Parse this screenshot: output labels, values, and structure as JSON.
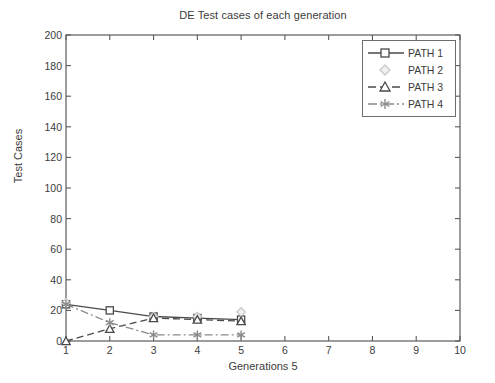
{
  "chart_data": {
    "type": "line",
    "title": "DE Test cases of each generation",
    "xlabel": "Generations 5",
    "ylabel": "Test Cases",
    "xlim": [
      1,
      10
    ],
    "ylim": [
      0,
      200
    ],
    "xticks": [
      "1",
      "2",
      "3",
      "4",
      "5",
      "6",
      "7",
      "8",
      "9",
      "10"
    ],
    "yticks": [
      "0",
      "20",
      "40",
      "60",
      "80",
      "100",
      "120",
      "140",
      "160",
      "180",
      "200"
    ],
    "grid": false,
    "legend_position": "top-right",
    "x": [
      1,
      2,
      3,
      4,
      5
    ],
    "series": [
      {
        "name": "PATH 1",
        "marker": "square",
        "linestyle": "solid",
        "color": "#4a4a4a",
        "values": [
          24,
          20,
          16,
          15,
          14
        ]
      },
      {
        "name": "PATH 2",
        "marker": "diamond",
        "linestyle": "none",
        "color": "#c9c9c9",
        "values": [
          25,
          null,
          16,
          16,
          19
        ]
      },
      {
        "name": "PATH 3",
        "marker": "triangle",
        "linestyle": "dashed",
        "color": "#4a4a4a",
        "values": [
          0,
          8,
          15,
          14,
          13
        ]
      },
      {
        "name": "PATH 4",
        "marker": "star",
        "linestyle": "dashdot",
        "color": "#8a8a8a",
        "values": [
          24,
          12,
          4,
          4,
          4
        ]
      }
    ]
  },
  "legend": {
    "entries": [
      {
        "label": "PATH 1"
      },
      {
        "label": "PATH 2"
      },
      {
        "label": "PATH 3"
      },
      {
        "label": "PATH 4"
      }
    ]
  },
  "colors": {
    "axis": "#5a5a5a",
    "text": "#3c3c3c",
    "background": "#ffffff",
    "path1": "#4a4a4a",
    "path2": "#c9c9c9",
    "path3": "#4a4a4a",
    "path4": "#8a8a8a"
  }
}
